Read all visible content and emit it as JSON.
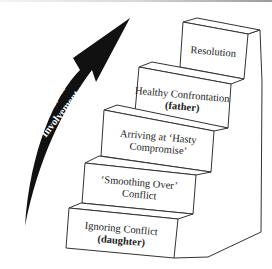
{
  "diagram": {
    "type": "staircase",
    "arrow": {
      "label_line1": "Energy &",
      "label_line2": "Involvement",
      "color": "#111111",
      "text_color": "#ffffff"
    },
    "steps": [
      {
        "order": 1,
        "line1": "Ignoring Conflict",
        "line2": "(daughter)",
        "line2_bold": true
      },
      {
        "order": 2,
        "line1": "‘Smoothing Over’",
        "line2": "Conflict",
        "line2_bold": false
      },
      {
        "order": 3,
        "line1": "Arriving at ‘Hasty",
        "line2": "Compromise’",
        "line2_bold": false
      },
      {
        "order": 4,
        "line1": "Healthy Confrontation",
        "line2": "(father)",
        "line2_bold": true
      },
      {
        "order": 5,
        "line1": "Resolution",
        "line2": "",
        "line2_bold": false
      }
    ]
  }
}
